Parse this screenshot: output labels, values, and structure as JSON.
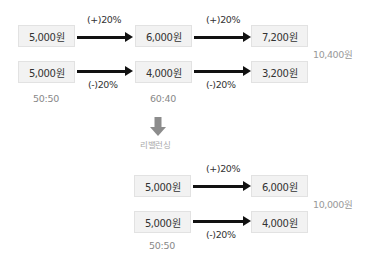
{
  "before": {
    "rows": [
      {
        "start": "5,000원",
        "change": "(+)20%",
        "mid": "6,000원",
        "change2": "(+)20%",
        "end": "7,200원"
      },
      {
        "start": "5,000원",
        "change": "(-)20%",
        "mid": "4,000원",
        "change2": "(-)20%",
        "end": "3,200원"
      }
    ],
    "start_ratio": "50:50",
    "mid_ratio": "60:40",
    "total": "10,400원"
  },
  "transition": {
    "icon": "down-arrow-icon",
    "label": "리밸런싱"
  },
  "after": {
    "rows": [
      {
        "start": "5,000원",
        "change": "(+)20%",
        "end": "6,000원"
      },
      {
        "start": "5,000원",
        "change": "(-)20%",
        "end": "4,000원"
      }
    ],
    "start_ratio": "50:50",
    "total": "10,000원"
  },
  "colors": {
    "box_bg": "#f2f2f2",
    "arrow": "#111111",
    "down_arrow": "#8c8c8c"
  }
}
